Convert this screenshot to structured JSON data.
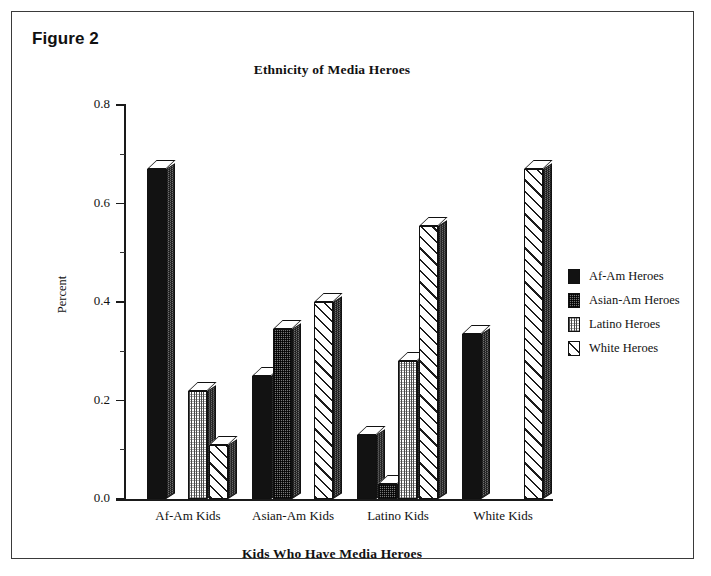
{
  "figure": {
    "label": "Figure 2"
  },
  "chart_data": {
    "type": "bar",
    "title": "Ethnicity of Media Heroes",
    "xlabel": "Kids Who Have Media Heroes",
    "ylabel": "Percent",
    "ylim": [
      0.0,
      0.8
    ],
    "ytick_labels": [
      "0.0",
      "0.2",
      "0.4",
      "0.6",
      "0.8"
    ],
    "ytick_values": [
      0.0,
      0.2,
      0.4,
      0.6,
      0.8
    ],
    "yminor_values": [
      0.1,
      0.3,
      0.5,
      0.7
    ],
    "grid": false,
    "legend_position": "right",
    "categories": [
      "Af-Am Kids",
      "Asian-Am Kids",
      "Latino Kids",
      "White Kids"
    ],
    "series": [
      {
        "name": "Af-Am Heroes",
        "pattern": "solid-black",
        "values": [
          0.67,
          0.25,
          0.13,
          0.335
        ]
      },
      {
        "name": "Asian-Am Heroes",
        "pattern": "dark-checker",
        "values": [
          0.0,
          0.345,
          0.03,
          0.0
        ]
      },
      {
        "name": "Latino Heroes",
        "pattern": "light-vertical-dots",
        "values": [
          0.22,
          0.0,
          0.28,
          0.0
        ]
      },
      {
        "name": "White Heroes",
        "pattern": "diagonal-hatch",
        "values": [
          0.11,
          0.4,
          0.555,
          0.67
        ]
      }
    ]
  },
  "legend": {
    "items": [
      {
        "label": "Af-Am Heroes",
        "pattern": "solid-black"
      },
      {
        "label": "Asian-Am Heroes",
        "pattern": "dark-checker"
      },
      {
        "label": "Latino Heroes",
        "pattern": "light-vertical-dots"
      },
      {
        "label": "White Heroes",
        "pattern": "diagonal-hatch"
      }
    ]
  },
  "colors": {
    "ink": "#111111",
    "frame": "#3a3a3a",
    "background": "#ffffff",
    "bar_side": "#6e6e6e"
  }
}
